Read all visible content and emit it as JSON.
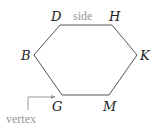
{
  "diagram": {
    "type": "hexagon",
    "vertices": [
      {
        "name": "D",
        "x": 60,
        "y": 25
      },
      {
        "name": "H",
        "x": 112,
        "y": 25
      },
      {
        "name": "K",
        "x": 137,
        "y": 55
      },
      {
        "name": "M",
        "x": 109,
        "y": 95
      },
      {
        "name": "G",
        "x": 62,
        "y": 95
      },
      {
        "name": "B",
        "x": 34,
        "y": 55
      }
    ],
    "labels": {
      "D": "D",
      "H": "H",
      "K": "K",
      "M": "M",
      "G": "G",
      "B": "B"
    },
    "annotations": {
      "side": "side",
      "vertex": "vertex"
    },
    "colors": {
      "stroke": "#444444",
      "annotation": "#999999"
    }
  }
}
